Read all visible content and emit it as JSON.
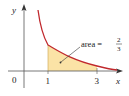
{
  "diagram": {
    "type": "area-under-curve",
    "function": "y = 1/x^2",
    "axes": {
      "x_label": "x",
      "y_label": "y",
      "origin_label": "0",
      "x_ticks": [
        "1",
        "3"
      ]
    },
    "shaded_interval": [
      1,
      3
    ],
    "annotation": {
      "prefix": "area =",
      "numerator": "2",
      "denominator": "3"
    },
    "colors": {
      "curve": "#c0282d",
      "fill": "#fbe3a6",
      "axes": "#555555",
      "text": "#222222"
    }
  }
}
